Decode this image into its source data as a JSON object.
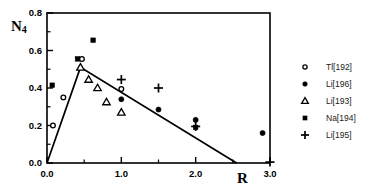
{
  "chart_data": {
    "type": "scatter",
    "title": "",
    "xlabel": "R",
    "ylabel": "N4",
    "ylabel_base": "N",
    "ylabel_sub": "4",
    "xlim": [
      0.0,
      3.0
    ],
    "ylim": [
      0.0,
      0.8
    ],
    "xticks": [
      "0.0",
      "1.0",
      "2.0",
      "3.0"
    ],
    "xtick_values": [
      0.0,
      1.0,
      2.0,
      3.0
    ],
    "yticks": [
      "0.0",
      "0.2",
      "0.4",
      "0.6",
      "0.8"
    ],
    "ytick_values": [
      0.0,
      0.2,
      0.4,
      0.6,
      0.8
    ],
    "xminor_values": [
      0.5,
      1.5,
      2.5
    ],
    "yminor_values": [
      0.1,
      0.3,
      0.5,
      0.7
    ],
    "grid": false,
    "legend_position": "right",
    "series": [
      {
        "name": "Tl[192]",
        "marker": "open-circle",
        "points": [
          {
            "x": 0.08,
            "y": 0.2
          },
          {
            "x": 0.22,
            "y": 0.35
          },
          {
            "x": 0.47,
            "y": 0.555
          },
          {
            "x": 1.0,
            "y": 0.395
          }
        ]
      },
      {
        "name": "Li[196]",
        "marker": "filled-circle",
        "points": [
          {
            "x": 1.0,
            "y": 0.34
          },
          {
            "x": 1.5,
            "y": 0.285
          },
          {
            "x": 2.0,
            "y": 0.23
          },
          {
            "x": 2.9,
            "y": 0.16
          }
        ]
      },
      {
        "name": "Li[193]",
        "marker": "open-triangle",
        "points": [
          {
            "x": 0.45,
            "y": 0.51
          },
          {
            "x": 0.56,
            "y": 0.445
          },
          {
            "x": 0.68,
            "y": 0.4
          },
          {
            "x": 0.8,
            "y": 0.325
          },
          {
            "x": 1.0,
            "y": 0.27
          }
        ]
      },
      {
        "name": "Na[194]",
        "marker": "filled-square",
        "points": [
          {
            "x": 0.07,
            "y": 0.415
          },
          {
            "x": 0.41,
            "y": 0.555
          },
          {
            "x": 0.62,
            "y": 0.655
          },
          {
            "x": 2.0,
            "y": 0.19
          }
        ]
      },
      {
        "name": "Li[195]",
        "marker": "plus",
        "points": [
          {
            "x": 1.0,
            "y": 0.445
          },
          {
            "x": 1.5,
            "y": 0.4
          },
          {
            "x": 2.0,
            "y": 0.195
          },
          {
            "x": 3.0,
            "y": 0.005
          }
        ]
      }
    ],
    "trend_line": {
      "name": "two-segment-fit",
      "vertices": [
        {
          "x": 0.0,
          "y": 0.0
        },
        {
          "x": 0.45,
          "y": 0.51
        },
        {
          "x": 2.55,
          "y": 0.0
        }
      ]
    },
    "colors": {
      "axis": "#000000",
      "marker": "#000000",
      "trend_line": "#000000",
      "legend_text": "#1a1a1a",
      "background": "#ffffff"
    }
  }
}
